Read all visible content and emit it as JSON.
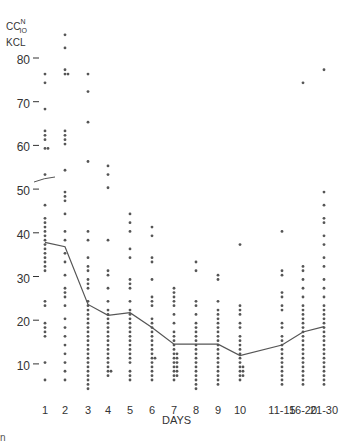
{
  "chart_data": {
    "type": "scatter",
    "title": "",
    "ylabel_line1": "CC",
    "ylabel_sup": "N",
    "ylabel_sub": "IO",
    "ylabel_line2": "KCL",
    "xlabel": "DAYS",
    "ylim": [
      5,
      88
    ],
    "yticks": [
      10,
      20,
      30,
      40,
      50,
      60,
      70,
      80
    ],
    "grid": false,
    "categories": [
      "1",
      "2",
      "3",
      "4",
      "5",
      "6",
      "7",
      "8",
      "9",
      "10",
      "11-15",
      "16-20",
      "21-30"
    ],
    "series": [
      {
        "name": "mean",
        "type": "line",
        "values": [
          38.5,
          37.5,
          24.3,
          21.8,
          22.4,
          19.0,
          15.2,
          15.2,
          15.2,
          12.6,
          15.0,
          18.0,
          19.2
        ]
      },
      {
        "name": "individual values",
        "type": "dot-strip",
        "points": [
          [
            77,
            75,
            69,
            64,
            63,
            62,
            60,
            60,
            54,
            47,
            44,
            43,
            42,
            41,
            40,
            39,
            38,
            37,
            36,
            35,
            34,
            33,
            32,
            25,
            24,
            20,
            19,
            18,
            17,
            11,
            7
          ],
          [
            86,
            83,
            78,
            77,
            77,
            64,
            63,
            62,
            61,
            55,
            50,
            49,
            48,
            45,
            41,
            39,
            36,
            34,
            31,
            28,
            27,
            26,
            24,
            21,
            19,
            17,
            15,
            13,
            11,
            9,
            7
          ],
          [
            77,
            73,
            66,
            57,
            41,
            39,
            35,
            33,
            32,
            30,
            29,
            28,
            25,
            24,
            23,
            22,
            21,
            20,
            19,
            18,
            17,
            16,
            15,
            14,
            13,
            12,
            11,
            10,
            9,
            8,
            7,
            6,
            5
          ],
          [
            56,
            54,
            51,
            39,
            32,
            31,
            28,
            25,
            23,
            22,
            21,
            20,
            19,
            18,
            17,
            16,
            15,
            14,
            13,
            12,
            11,
            10,
            9,
            9,
            8
          ],
          [
            45,
            43,
            41,
            37,
            35,
            30,
            29,
            28,
            25,
            23,
            22,
            21,
            20,
            19,
            18,
            17,
            16,
            15,
            14,
            13,
            12,
            11,
            9,
            8,
            7
          ],
          [
            42,
            40,
            35,
            34,
            30,
            26,
            25,
            24,
            21,
            20,
            19,
            18,
            17,
            16,
            15,
            14,
            13,
            12,
            12,
            11,
            10,
            9,
            8,
            7
          ],
          [
            28,
            27,
            26,
            25,
            24,
            22,
            20,
            18,
            17,
            16,
            15,
            14,
            13,
            13,
            12,
            12,
            11,
            11,
            10,
            10,
            9,
            9,
            8,
            8,
            7
          ],
          [
            34,
            32,
            25,
            24,
            22,
            20,
            19,
            18,
            17,
            16,
            15,
            14,
            13,
            12,
            11,
            10,
            9,
            8,
            7,
            6,
            5
          ],
          [
            31,
            30,
            25,
            23,
            22,
            21,
            20,
            19,
            18,
            17,
            16,
            15,
            14,
            13,
            12,
            11,
            10,
            9,
            8,
            7,
            6
          ],
          [
            38,
            24,
            23,
            22,
            20,
            19,
            17,
            16,
            15,
            14,
            13,
            12,
            11,
            10,
            10,
            9,
            9,
            8,
            8,
            7
          ],
          [
            41,
            32,
            31,
            27,
            26,
            24,
            23,
            20,
            19,
            17,
            16,
            15,
            14,
            13,
            12,
            11,
            10,
            9,
            8,
            7,
            6
          ],
          [
            75,
            33,
            32,
            30,
            28,
            26,
            24,
            23,
            22,
            21,
            20,
            19,
            18,
            17,
            16,
            15,
            14,
            13,
            12,
            11,
            10,
            9,
            8,
            7,
            6
          ],
          [
            78,
            50,
            47,
            44,
            43,
            40,
            38,
            35,
            33,
            30,
            28,
            26,
            24,
            23,
            22,
            21,
            20,
            19,
            18,
            17,
            16,
            15,
            14,
            13,
            12,
            11,
            10,
            9,
            8,
            7,
            6
          ]
        ]
      }
    ],
    "annotations": [
      "short line segment near 52-54 beside day 1"
    ],
    "legend": null
  },
  "axis": {
    "y_label_top": "CC",
    "y_label_sup": "N",
    "y_label_sub": "IO",
    "y_label_bottom": "KCL",
    "x_title": "DAYS",
    "y_ticks": [
      "80",
      "70",
      "60",
      "50",
      "40",
      "30",
      "20",
      "10"
    ],
    "x_ticks": [
      "1",
      "2",
      "3",
      "4",
      "5",
      "6",
      "7",
      "8",
      "9",
      "10",
      "11-15",
      "16-20",
      "21-30"
    ]
  },
  "corner_mark": "n",
  "colors": {
    "dots": "#555555",
    "line": "#555555",
    "text": "#333333"
  }
}
